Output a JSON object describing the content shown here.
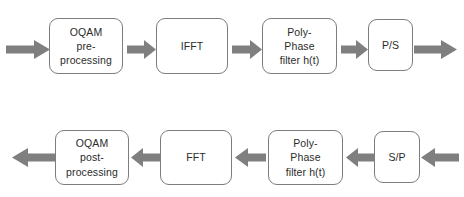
{
  "diagram": {
    "background_color": "#ffffff",
    "block_border_color": "#7d7d7d",
    "block_fill_color": "#ffffff",
    "arrow_color": "#7f7f7f",
    "text_color": "#2b2b2b",
    "rows": [
      {
        "name": "transmitter-chain",
        "direction": "left-to-right",
        "blocks": [
          {
            "id": "oqam-pre-processing",
            "label": "OQAM\npre-\nprocessing"
          },
          {
            "id": "ifft",
            "label": "IFFT"
          },
          {
            "id": "poly-phase-filter-tx",
            "label": "Poly-\nPhase\nfilter h(t)"
          },
          {
            "id": "parallel-to-serial",
            "label": "P/S"
          }
        ]
      },
      {
        "name": "receiver-chain",
        "direction": "right-to-left",
        "blocks": [
          {
            "id": "oqam-post-processing",
            "label": "OQAM\npost-\nprocessing"
          },
          {
            "id": "fft",
            "label": "FFT"
          },
          {
            "id": "poly-phase-filter-rx",
            "label": "Poly-\nPhase\nfilter h(t)"
          },
          {
            "id": "serial-to-parallel",
            "label": "S/P"
          }
        ]
      }
    ],
    "arrows": [
      {
        "id": "tx-input-arrow",
        "direction": "right"
      },
      {
        "id": "tx-arrow-oqam-to-ifft",
        "direction": "right"
      },
      {
        "id": "tx-arrow-ifft-to-polyphase",
        "direction": "right"
      },
      {
        "id": "tx-arrow-polyphase-to-ps",
        "direction": "right"
      },
      {
        "id": "tx-output-arrow",
        "direction": "right"
      },
      {
        "id": "rx-output-arrow",
        "direction": "left"
      },
      {
        "id": "rx-arrow-fft-to-oqam",
        "direction": "left"
      },
      {
        "id": "rx-arrow-polyphase-to-fft",
        "direction": "left"
      },
      {
        "id": "rx-arrow-sp-to-polyphase",
        "direction": "left"
      },
      {
        "id": "rx-input-arrow",
        "direction": "left"
      }
    ]
  }
}
